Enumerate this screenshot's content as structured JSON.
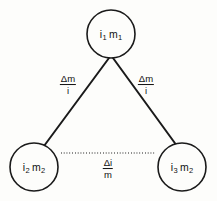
{
  "diagram": {
    "type": "triangle-node-graph",
    "background_color": "#fdfdfb",
    "stroke_color": "#1a1a1a",
    "nodes": [
      {
        "id": "top",
        "name": "node-top",
        "label_full": "i1 m1",
        "symbol_1": "i",
        "subscript_1": "1",
        "symbol_2": "m",
        "subscript_2": "1",
        "cx": 111,
        "cy": 34,
        "r": 24
      },
      {
        "id": "bottom-left",
        "name": "node-bottom-left",
        "label_full": "i2 m2",
        "symbol_1": "i",
        "subscript_1": "2",
        "symbol_2": "m",
        "subscript_2": "2",
        "cx": 34,
        "cy": 167,
        "r": 24
      },
      {
        "id": "bottom-right",
        "name": "node-bottom-right",
        "label_full": "i3 m2",
        "symbol_1": "i",
        "subscript_1": "3",
        "symbol_2": "m",
        "subscript_2": "2",
        "cx": 182,
        "cy": 167,
        "r": 24
      }
    ],
    "edges": [
      {
        "id": "left-edge",
        "name": "edge-top-to-bottom-left",
        "style": "solid",
        "from": "top",
        "to": "bottom-left",
        "x1": 109,
        "y1": 58,
        "x2": 44,
        "y2": 146,
        "label": {
          "numerator": "Δm",
          "denominator": "i",
          "x": 68,
          "y": 85
        }
      },
      {
        "id": "right-edge",
        "name": "edge-top-to-bottom-right",
        "style": "solid",
        "from": "top",
        "to": "bottom-right",
        "x1": 113,
        "y1": 58,
        "x2": 177,
        "y2": 146,
        "label": {
          "numerator": "Δm",
          "denominator": "i",
          "x": 146,
          "y": 85
        }
      },
      {
        "id": "bottom-edge",
        "name": "edge-bottom-left-to-bottom-right",
        "style": "dotted",
        "from": "bottom-left",
        "to": "bottom-right",
        "x1": 61,
        "y1": 153,
        "x2": 155,
        "y2": 153,
        "label": {
          "numerator": "Δi",
          "denominator": "m",
          "x": 108,
          "y": 169
        }
      }
    ]
  }
}
